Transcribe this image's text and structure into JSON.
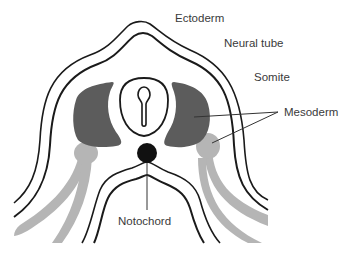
{
  "figure": {
    "labels": {
      "ectoderm": "Ectoderm",
      "neural_tube": "Neural tube",
      "somite": "Somite",
      "mesoderm": "Mesoderm",
      "notochord": "Notochord"
    },
    "colors": {
      "line": "#1a1a1a",
      "somite": "#5c5c5c",
      "mesoderm": "#b5b5b5",
      "notochord": "#111111",
      "label_text": "#3a3a3a",
      "leader": "#333333"
    }
  }
}
